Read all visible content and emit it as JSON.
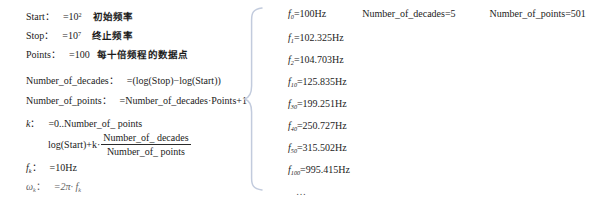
{
  "document": {
    "type": "mathcad-worksheet-excerpt",
    "brace_color": "#c2cbdd"
  },
  "definitions": {
    "start": {
      "name": "Start",
      "colon": "：",
      "assign": "=10",
      "exponent": "2",
      "note": "初始频率"
    },
    "stop": {
      "name": "Stop",
      "colon": "：",
      "assign": "=10",
      "exponent": "7",
      "note": "终止频率"
    },
    "points": {
      "name": "Points",
      "colon": "：",
      "assign": "=100",
      "note": "每十倍频程的数据点"
    },
    "number_of_decades": {
      "name": "Number_of_decades",
      "colon": "：",
      "assign": "=(log(Stop)−log(Start))"
    },
    "number_of_points": {
      "name": "Number_of_points",
      "colon": "：",
      "assign": "=Number_of_decades·Points+1"
    },
    "k": {
      "name": "k",
      "colon": "：",
      "assign": "=0..Number_of_ points"
    },
    "fk_formula": {
      "lead": "log(Start)+k·",
      "numerator": "Number_of_ decades",
      "denominator": "Number_of_ points"
    },
    "fk": {
      "name": "f",
      "subscript": "k",
      "colon": "：",
      "assign": "=10Hz"
    },
    "omega_k": {
      "name": "ω",
      "subscript": "k",
      "colon": "：",
      "assign": "=2π· f",
      "assign_subscript": "k"
    }
  },
  "results": {
    "top_row": [
      {
        "label": "f",
        "subscript": "0",
        "value": "=100Hz"
      },
      {
        "label": "Number_of_decades",
        "subscript": "",
        "value": "=5"
      },
      {
        "label": "Number_of_points",
        "subscript": "",
        "value": "=501"
      }
    ],
    "frequencies": [
      {
        "label": "f",
        "subscript": "1",
        "value": "=102.325Hz"
      },
      {
        "label": "f",
        "subscript": "2",
        "value": "=104.703Hz"
      },
      {
        "label": "f",
        "subscript": "10",
        "value": "=125.835Hz"
      },
      {
        "label": "f",
        "subscript": "30",
        "value": "=199.251Hz"
      },
      {
        "label": "f",
        "subscript": "40",
        "value": "=250.727Hz"
      },
      {
        "label": "f",
        "subscript": "50",
        "value": "=315.502Hz"
      },
      {
        "label": "f",
        "subscript": "100",
        "value": "=995.415Hz"
      }
    ],
    "ellipsis": "…"
  }
}
